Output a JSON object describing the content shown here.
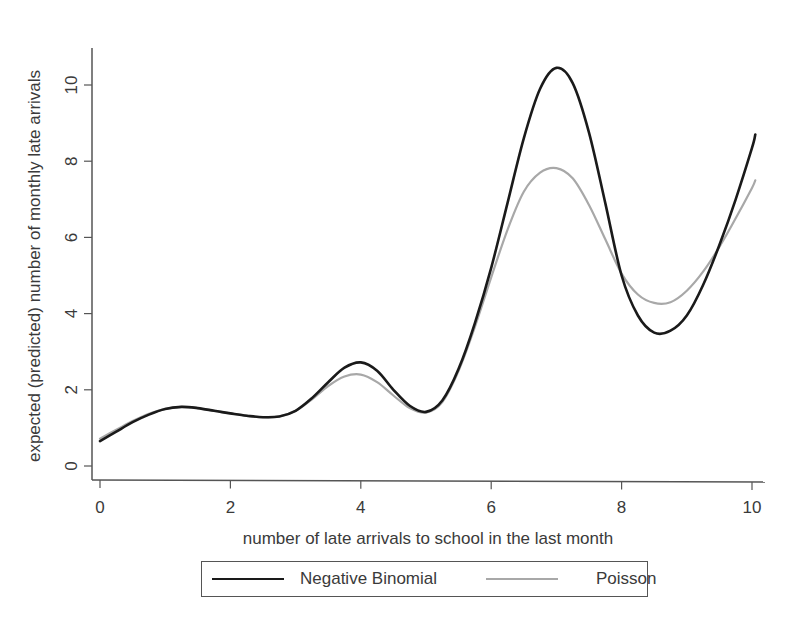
{
  "chart_data": {
    "type": "line",
    "title": "",
    "xlabel": "number of late arrivals to school in the last month",
    "ylabel": "expected (predicted) number of monthly late arrivals",
    "xlim": [
      0,
      10.1
    ],
    "ylim": [
      0,
      10.9
    ],
    "x_ticks": [
      0,
      2,
      4,
      6,
      8,
      10
    ],
    "y_ticks": [
      0,
      2,
      4,
      6,
      8,
      10
    ],
    "x_tick_labels": [
      "0",
      "2",
      "4",
      "6",
      "8",
      "10"
    ],
    "y_tick_labels": [
      "0",
      "2",
      "4",
      "6",
      "8",
      "10"
    ],
    "grid": false,
    "legend_position": "bottom",
    "series": [
      {
        "name": "Negative Binomial",
        "color": "#1a1a1a",
        "x": [
          0,
          0.25,
          0.5,
          0.75,
          1,
          1.25,
          1.5,
          1.75,
          2,
          2.25,
          2.5,
          2.75,
          3,
          3.25,
          3.5,
          3.75,
          4,
          4.25,
          4.5,
          4.75,
          5,
          5.25,
          5.5,
          5.75,
          6,
          6.25,
          6.5,
          6.75,
          7,
          7.25,
          7.5,
          7.75,
          8,
          8.25,
          8.5,
          8.75,
          9,
          9.25,
          9.5,
          9.75,
          10,
          10.05
        ],
        "values": [
          0.65,
          0.9,
          1.15,
          1.35,
          1.5,
          1.55,
          1.52,
          1.45,
          1.38,
          1.32,
          1.28,
          1.3,
          1.45,
          1.78,
          2.2,
          2.58,
          2.72,
          2.5,
          2.0,
          1.58,
          1.42,
          1.72,
          2.55,
          3.75,
          5.2,
          6.9,
          8.6,
          9.9,
          10.45,
          10.05,
          8.75,
          6.9,
          5.0,
          3.95,
          3.5,
          3.55,
          3.95,
          4.75,
          5.8,
          7.0,
          8.35,
          8.7
        ]
      },
      {
        "name": "Poisson",
        "color": "#a8a8a8",
        "x": [
          0,
          0.25,
          0.5,
          0.75,
          1,
          1.25,
          1.5,
          1.75,
          2,
          2.25,
          2.5,
          2.75,
          3,
          3.25,
          3.5,
          3.75,
          4,
          4.25,
          4.5,
          4.75,
          5,
          5.25,
          5.5,
          5.75,
          6,
          6.25,
          6.5,
          6.75,
          7,
          7.25,
          7.5,
          7.75,
          8,
          8.25,
          8.5,
          8.75,
          9,
          9.25,
          9.5,
          9.75,
          10,
          10.05
        ],
        "values": [
          0.72,
          0.95,
          1.18,
          1.37,
          1.5,
          1.55,
          1.52,
          1.45,
          1.38,
          1.32,
          1.28,
          1.3,
          1.45,
          1.75,
          2.1,
          2.35,
          2.4,
          2.2,
          1.85,
          1.52,
          1.4,
          1.68,
          2.5,
          3.65,
          4.95,
          6.2,
          7.2,
          7.7,
          7.82,
          7.55,
          6.85,
          5.95,
          5.05,
          4.5,
          4.28,
          4.3,
          4.6,
          5.1,
          5.75,
          6.5,
          7.3,
          7.5
        ]
      }
    ]
  },
  "legend": {
    "items": [
      {
        "label": "Negative Binomial",
        "color": "#1a1a1a"
      },
      {
        "label": "Poisson",
        "color": "#a8a8a8"
      }
    ]
  }
}
